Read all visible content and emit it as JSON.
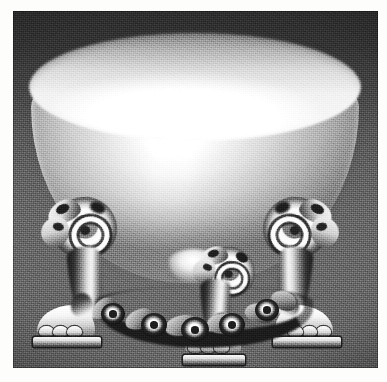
{
  "document": {
    "type": "scanned-photograph",
    "page_width": 387,
    "page_height": 382,
    "paper_color": "#fdfdfb",
    "caption": ""
  },
  "photo": {
    "name": "rococo-footed-bowl",
    "subject": "Silver rococo footed bowl (tazza) on three scrolled legs with paw feet",
    "medium": "halftone monochrome print",
    "frame": {
      "left": 13,
      "top": 11,
      "width": 365,
      "height": 357
    },
    "palette": {
      "background_top": "#343434",
      "background_mid": "#6d6d6d",
      "background_bottom": "#545454",
      "highlight": "#ffffff",
      "midtone": "#bdbdbd",
      "shadow": "#232323"
    }
  },
  "subject_parts": {
    "bowl": {
      "label": "Bowl",
      "description": "Wide plain polished bowl, elliptical rim, tapering to a rounded nub"
    },
    "rim": {
      "label": "Rim"
    },
    "nub": {
      "label": "Base nub"
    },
    "legs": [
      {
        "label": "Left leg",
        "ornament": "volute scroll with acanthus",
        "foot": "paw foot on plinth"
      },
      {
        "label": "Centre rear leg",
        "ornament": "volute scroll",
        "foot": "paw foot on plinth"
      },
      {
        "label": "Right leg",
        "ornament": "volute scroll with acanthus",
        "foot": "paw foot on plinth"
      }
    ],
    "garland": {
      "label": "Garland swag",
      "description": "Floral rocaille swag linking the three legs",
      "rosette_count": 5
    }
  }
}
